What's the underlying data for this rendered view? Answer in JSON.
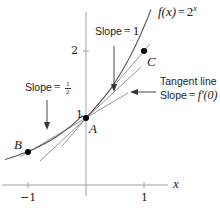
{
  "diagram": {
    "function_label": "f(x) = 2^x",
    "function_label_parts": {
      "lhs": "f(x)",
      "eq": "=",
      "base": "2",
      "exp": "x"
    },
    "axis": {
      "x_label": "x",
      "x_ticks": [
        "−1",
        "1"
      ],
      "y_ticks": [
        "1",
        "2"
      ]
    },
    "points": {
      "A": {
        "label": "A",
        "x": 0,
        "y": 1
      },
      "B": {
        "label": "B",
        "x": -1,
        "y": 0.5
      },
      "C": {
        "label": "C",
        "x": 1,
        "y": 2
      }
    },
    "annotations": {
      "slope_one": {
        "prefix": "Slope",
        "eq": "=",
        "value": "1"
      },
      "slope_half": {
        "prefix": "Slope",
        "eq": "=",
        "num": "1",
        "den": "2"
      },
      "tangent": {
        "line1": "Tangent line",
        "prefix": "Slope",
        "eq": "=",
        "value": "f′(0)"
      }
    },
    "colors": {
      "curve": "#555555",
      "axis": "#999999",
      "lines": "#888888",
      "points": "#000000",
      "text": "#222222"
    }
  }
}
